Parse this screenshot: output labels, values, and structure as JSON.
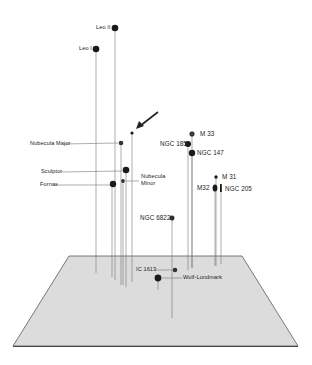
{
  "diagram": {
    "type": "3d-perspective-galaxy-map",
    "plane": {
      "fill": "#dcdcdc",
      "stroke": "#555555"
    },
    "pointer_arrow": {
      "from": [
        158,
        112
      ],
      "to": [
        137,
        128
      ]
    },
    "galaxies": [
      {
        "name": "Leo II",
        "label": "Leo II",
        "x": 115,
        "y": 28,
        "r": 3.3,
        "base": 280
      },
      {
        "name": "Leo I",
        "label": "Leo I",
        "x": 96,
        "y": 49,
        "r": 3.3,
        "base": 273
      },
      {
        "name": "Unlabeled (arrow)",
        "label": "",
        "x": 132,
        "y": 133,
        "r": 1.6,
        "base": 282
      },
      {
        "name": "Nubecula Major",
        "label": "Nubecula Major",
        "x": 121,
        "y": 143,
        "r": 2.3,
        "base": 285
      },
      {
        "name": "Sculptor",
        "label": "Sculptor",
        "x": 126,
        "y": 170,
        "r": 3.3,
        "base": 287
      },
      {
        "name": "Nubecula Minor",
        "label": "Nubecula Minor",
        "x": 123,
        "y": 181,
        "r": 1.9,
        "base": 285
      },
      {
        "name": "Fornax",
        "label": "Fornax",
        "x": 114,
        "y": 184,
        "r": 3.2,
        "base": 277
      },
      {
        "name": "M 33",
        "label": "M 33",
        "x": 192,
        "y": 134,
        "r": 2.2,
        "base": 268
      },
      {
        "name": "NGC 185",
        "label": "NGC 185",
        "x": 188,
        "y": 144,
        "r": 3.0,
        "base": 270
      },
      {
        "name": "NGC 147",
        "label": "NGC 147",
        "x": 192,
        "y": 153,
        "r": 3.2,
        "base": 268
      },
      {
        "name": "M 31",
        "label": "M 31",
        "x": 216,
        "y": 177,
        "r": 1.7,
        "base": 266
      },
      {
        "name": "M32",
        "label": "M32",
        "x": 215,
        "y": 188,
        "r": 2.6,
        "base": 266
      },
      {
        "name": "NGC 205",
        "label": "NGC 205",
        "x": 221,
        "y": 188,
        "r": 1.3,
        "base": 264
      },
      {
        "name": "NGC 6822",
        "label": "NGC 6822",
        "x": 172,
        "y": 218,
        "r": 2.2,
        "base": 318
      },
      {
        "name": "IC 1613",
        "label": "IC 1613",
        "x": 175,
        "y": 270,
        "r": 2.3,
        "base": 270
      },
      {
        "name": "Wolf-Lundmark",
        "label": "Wolf-Lundmark",
        "x": 158,
        "y": 278,
        "r": 3.4,
        "base": 290
      }
    ]
  },
  "labels": {
    "leo2": "Leo II",
    "leo1": "Leo I",
    "nub_major": "Nubecula Major",
    "sculptor": "Sculptor",
    "fornax": "Fornax",
    "nub_minor_1": "Nubecula",
    "nub_minor_2": "Minor",
    "m33": "M 33",
    "ngc185": "NGC 185",
    "ngc147": "NGC 147",
    "m31": "M 31",
    "m32": "M32",
    "ngc205": "NGC 205",
    "ngc6822": "NGC 6822",
    "ic1613": "IC 1613",
    "wolf": "Wolf-Lundmark"
  }
}
